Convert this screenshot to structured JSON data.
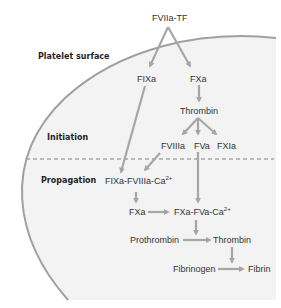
{
  "diagram": {
    "regions": {
      "surface_label": "Platelet surface",
      "initiation_label": "Initiation",
      "propagation_label": "Propagation"
    },
    "nodes": {
      "fviia_tf": "FVIIa-TF",
      "fixa": "FIXa",
      "fxa_top": "FXa",
      "thrombin_top": "Thrombin",
      "fviiia": "FVIIIa",
      "fva": "FVa",
      "fxia": "FXIa",
      "tenase_main": "FIXa-FVIIIa-Ca",
      "tenase_sup": "2+",
      "fxa_bottom": "FXa",
      "prothrombinase_main": "FXa-FVa-Ca",
      "prothrombinase_sup": "2+",
      "prothrombin": "Prothrombin",
      "thrombin_bottom": "Thrombin",
      "fibrinogen": "Fibrinogen",
      "fibrin": "Fibrin"
    },
    "edges": [
      {
        "from": "FVIIa-TF",
        "to": "FIXa"
      },
      {
        "from": "FVIIa-TF",
        "to": "FXa"
      },
      {
        "from": "FXa",
        "to": "Thrombin"
      },
      {
        "from": "Thrombin",
        "to": "FVIIIa"
      },
      {
        "from": "Thrombin",
        "to": "FVa"
      },
      {
        "from": "Thrombin",
        "to": "FXIa"
      },
      {
        "from": "FIXa",
        "to": "FIXa-FVIIIa-Ca2+"
      },
      {
        "from": "FVIIIa",
        "to": "FIXa-FVIIIa-Ca2+"
      },
      {
        "from": "FVa",
        "to": "FXa-FVa-Ca2+"
      },
      {
        "from": "FIXa-FVIIIa-Ca2+",
        "to": "FXa"
      },
      {
        "from": "FXa",
        "to": "FXa-FVa-Ca2+"
      },
      {
        "from": "FXa-FVa-Ca2+",
        "to": "Prothrombin→Thrombin"
      },
      {
        "from": "Prothrombin",
        "to": "Thrombin"
      },
      {
        "from": "Thrombin",
        "to": "Fibrinogen→Fibrin"
      },
      {
        "from": "Fibrinogen",
        "to": "Fibrin"
      }
    ],
    "colors": {
      "arrow": "#a6a6a6",
      "membrane": "#a0a0a0",
      "cell_fill": "#f3f3f3",
      "text": "#333333",
      "dashed_line": "#a6a6a6"
    }
  }
}
